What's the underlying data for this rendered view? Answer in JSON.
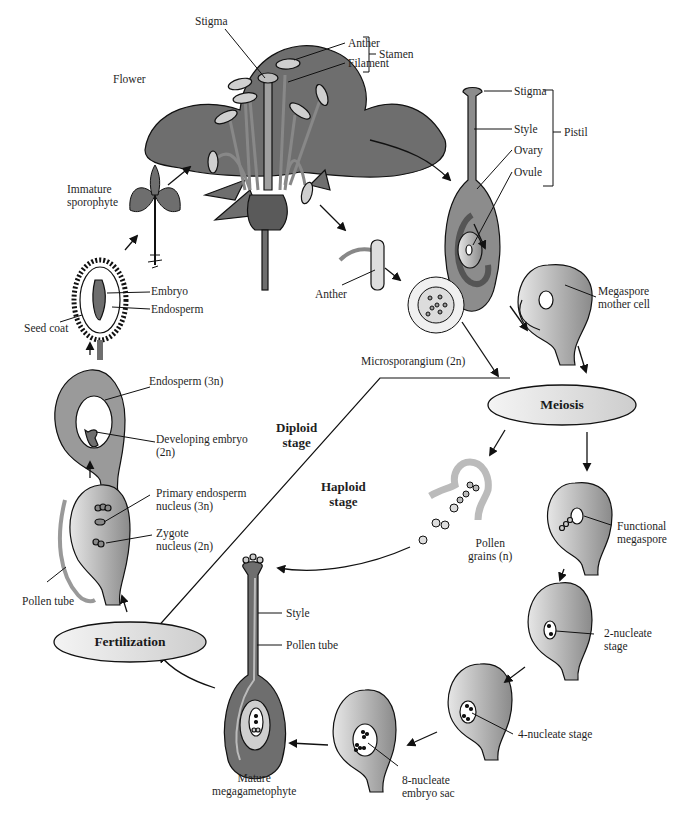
{
  "colors": {
    "tissue_dark": "#6e6e6e",
    "tissue_mid": "#9a9a9a",
    "tissue_light": "#cfcfcf",
    "pill_fill": "#e6e6e6",
    "line": "#111111",
    "background": "#ffffff"
  },
  "labels": {
    "flower": "Flower",
    "stigma_top": "Stigma",
    "anther_top": "Anther",
    "filament": "Filament",
    "stamen": "Stamen",
    "pistil_stigma": "Stigma",
    "pistil_style": "Style",
    "pistil": "Pistil",
    "ovary": "Ovary",
    "ovule": "Ovule",
    "megaspore_mother_cell_1": "Megaspore",
    "megaspore_mother_cell_2": "mother cell",
    "anther_mid": "Anther",
    "microsporangium": "Microsporangium (2n)",
    "immature_sporophyte_1": "Immature",
    "immature_sporophyte_2": "sporophyte",
    "embryo": "Embryo",
    "endosperm": "Endosperm",
    "seed_coat": "Seed coat",
    "endosperm_3n": "Endosperm (3n)",
    "developing_embryo_1": "Developing embryo",
    "developing_embryo_2": "(2n)",
    "diploid_stage_1": "Diploid",
    "diploid_stage_2": "stage",
    "haploid_stage_1": "Haploid",
    "haploid_stage_2": "stage",
    "primary_endosperm_1": "Primary endosperm",
    "primary_endosperm_2": "nucleus (3n)",
    "zygote_1": "Zygote",
    "zygote_2": "nucleus (2n)",
    "pollen_tube_left": "Pollen tube",
    "pollen_grains_1": "Pollen",
    "pollen_grains_2": "grains (n)",
    "functional_megaspore_1": "Functional",
    "functional_megaspore_2": "megaspore",
    "style_bottom": "Style",
    "pollen_tube_bottom": "Pollen tube",
    "two_nucleate_1": "2-nucleate",
    "two_nucleate_2": "stage",
    "four_nucleate": "4-nucleate stage",
    "eight_nucleate_1": "8-nucleate",
    "eight_nucleate_2": "embryo sac",
    "mature_mega_1": "Mature",
    "mature_mega_2": "megagametophyte"
  },
  "process_nodes": {
    "meiosis": "Meiosis",
    "fertilization": "Fertilization"
  }
}
